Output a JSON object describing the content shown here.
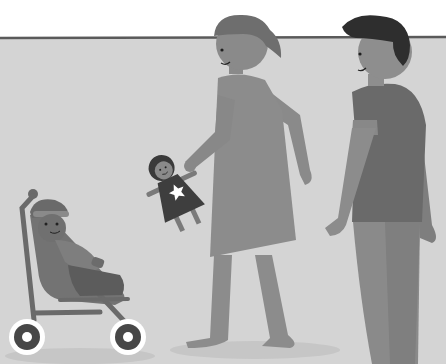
{
  "scene": {
    "description": "Grayscale flat illustration of a family walking: a woman holding a doll, a man, and a baby in a stroller",
    "colors": {
      "sky": "#ffffff",
      "wall": "#d4d4d4",
      "horizon_line": "#5a5a5a",
      "woman_hair": "#6e6e6e",
      "woman_skin": "#8a8a8a",
      "woman_dress": "#8c8c8c",
      "man_hair": "#2e2e2e",
      "man_skin": "#8e8e8e",
      "man_shirt": "#6a6a6a",
      "man_pants": "#8a8a8a",
      "doll_dress": "#3e3e3e",
      "doll_hair": "#3a3a3a",
      "doll_star": "#ffffff",
      "stroller_frame": "#6a6a6a",
      "stroller_seat": "#737373",
      "wheel_outer": "#ffffff",
      "wheel_inner": "#474747",
      "baby_skin": "#707070",
      "shadow": "#c4c4c4"
    },
    "figures": [
      {
        "name": "woman",
        "holding": "doll"
      },
      {
        "name": "man"
      },
      {
        "name": "baby",
        "in": "stroller"
      }
    ]
  }
}
